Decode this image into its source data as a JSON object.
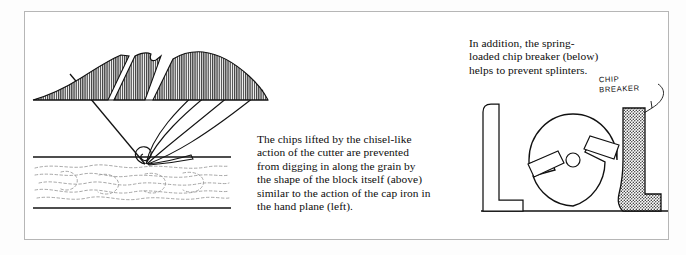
{
  "figure": {
    "frame": {
      "border_color": "#b6b6b6",
      "background": "#ffffff"
    },
    "ink_color": "#101010",
    "hatch_color": "#4a4a4a",
    "grain_color": "#9a9a9a"
  },
  "captions": {
    "center": {
      "name": "chip-lifting-caption",
      "lines": [
        "The chips lifted by the chisel-like",
        "action of the cutter are prevented",
        "from digging in along the grain by",
        "the shape of the block itself (above)",
        "similar to the action of the cap iron in",
        "the hand plane (left)."
      ]
    },
    "right": {
      "name": "chip-breaker-caption",
      "lines": [
        "In addition, the spring-",
        "loaded chip breaker (below)",
        "helps to prevent splinters."
      ]
    }
  },
  "annotations": {
    "chip_breaker_label": {
      "line1": "CHIP",
      "line2": "BREAKER"
    }
  },
  "diagrams": {
    "hand_plane": {
      "name": "hand-plane-chip-diagram",
      "description": "Blade meeting wood surface with chip curling up and wood grain below"
    },
    "chip_mound": {
      "name": "chip-mound-diagram",
      "description": "Hatched mound of lifted chips split by two diagonal gaps"
    },
    "cutterhead": {
      "name": "cutterhead-chip-breaker-diagram",
      "description": "Circular cutterhead with two angled knives, fence at left and hatched spring-loaded chip breaker shoe at right"
    }
  }
}
